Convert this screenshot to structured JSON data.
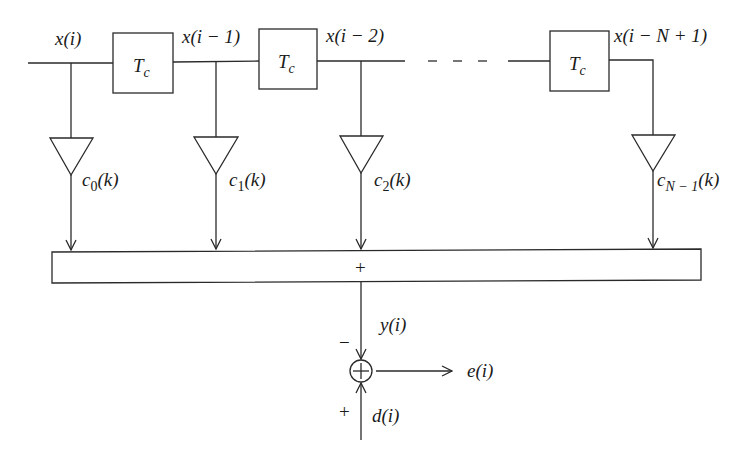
{
  "diagram": {
    "colors": {
      "line": "#2a2a2a",
      "text": "#1a1a1a",
      "background": "#ffffff"
    },
    "signals": {
      "x0": "x(i)",
      "x1": "x(i − 1)",
      "x2": "x(i − 2)",
      "xN": "x(i − N + 1)"
    },
    "delay_blocks": [
      {
        "main": "T",
        "sub": "c"
      },
      {
        "main": "T",
        "sub": "c"
      },
      {
        "main": "T",
        "sub": "c"
      }
    ],
    "coefficients": [
      {
        "main": "c",
        "sub": "0",
        "arg": "(k)"
      },
      {
        "main": "c",
        "sub": "1",
        "arg": "(k)"
      },
      {
        "main": "c",
        "sub": "2",
        "arg": "(k)"
      },
      {
        "main": "c",
        "sub": "N − 1",
        "arg": "(k)"
      }
    ],
    "summer": {
      "symbol": "+"
    },
    "output": "y(i)",
    "desired": "d(i)",
    "error": "e(i)",
    "comparator": {
      "symbol": "⊕",
      "minus_sign": "−",
      "plus_sign": "+"
    },
    "ellipsis": "- - -"
  }
}
